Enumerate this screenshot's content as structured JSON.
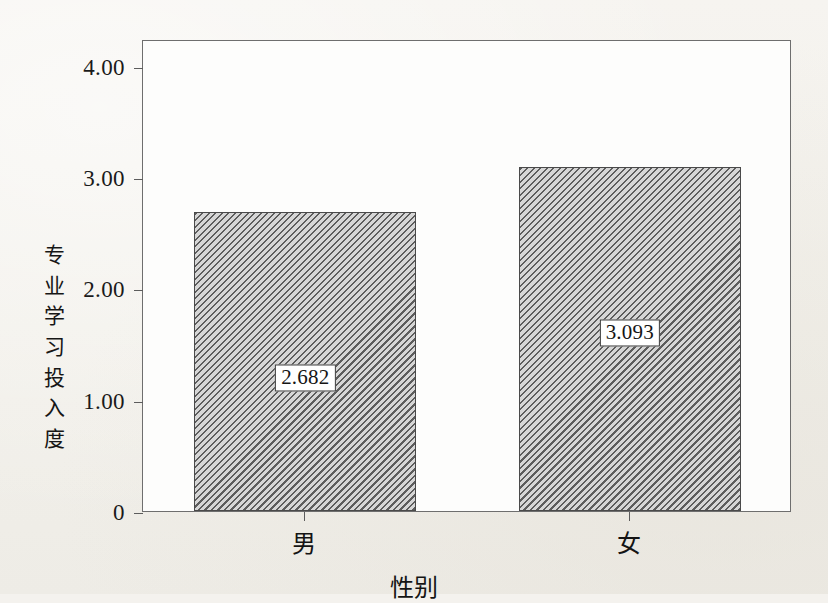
{
  "chart_data": {
    "type": "bar",
    "title": "",
    "subtitle": "",
    "xlabel": "性别",
    "ylabel": "专业学习投入度",
    "ylabel_chars": [
      "专",
      "业",
      "学",
      "习",
      "投",
      "入",
      "度"
    ],
    "categories": [
      "男",
      "女"
    ],
    "values": [
      2.682,
      3.093
    ],
    "value_labels": [
      "2.682",
      "3.093"
    ],
    "ytick_labels": [
      "4.00",
      "3.00",
      "2.00",
      "1.00",
      "0"
    ],
    "ytick_values": [
      4,
      3,
      2,
      1,
      0
    ],
    "ylim": [
      0,
      4.24
    ],
    "grid": false,
    "legend": null,
    "bar_fill": "#c9c9c9",
    "bar_hatch": "diagonal-lines",
    "bar_edge_color": "#4a4a4a",
    "frame_color": "#6e6e6e",
    "background_color": "#f4f2ee",
    "plot_background_color": "#fdfdfc",
    "text_color": "#151515"
  }
}
